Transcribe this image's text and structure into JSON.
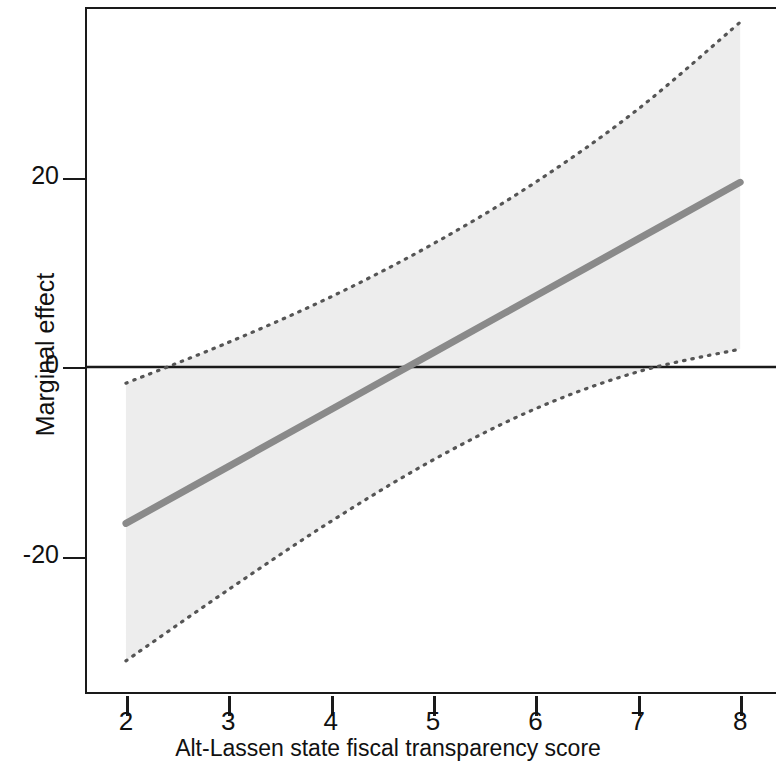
{
  "chart_data": {
    "type": "line",
    "title": "",
    "subtitle": "",
    "xlabel": "Alt-Lassen state fiscal transparency score",
    "ylabel": "Marginal effect",
    "xlim": [
      1.6,
      8.35
    ],
    "ylim": [
      -34.5,
      38.0
    ],
    "xticks": [
      2,
      3,
      4,
      5,
      6,
      7,
      8
    ],
    "xticklabels": [
      "2",
      "3",
      "4",
      "5",
      "6",
      "7",
      "8"
    ],
    "yticks": [
      20,
      0,
      -20
    ],
    "yticklabels": [
      "20",
      "0",
      "-20"
    ],
    "grid": false,
    "legend": null,
    "zero_reference_line": 0,
    "series": [
      {
        "name": "Marginal effect",
        "style": "solid",
        "color": "#8a8a8a",
        "linewidth": 7,
        "x": [
          2,
          3,
          4,
          5,
          6,
          7,
          8
        ],
        "values": [
          -16.5,
          -10.5,
          -4.5,
          1.5,
          7.5,
          13.5,
          19.5
        ]
      },
      {
        "name": "Upper 95% confidence bound",
        "style": "dotted",
        "color": "#555555",
        "linewidth": 3,
        "x": [
          2,
          3,
          4,
          5,
          6,
          7,
          8
        ],
        "values": [
          -1.7,
          2.6,
          7.4,
          13.0,
          19.5,
          27.2,
          36.4
        ]
      },
      {
        "name": "Lower 95% confidence bound",
        "style": "dotted",
        "color": "#555555",
        "linewidth": 3,
        "x": [
          2,
          3,
          4,
          5,
          6,
          7,
          8
        ],
        "values": [
          -31.0,
          -23.5,
          -16.3,
          -9.8,
          -4.4,
          -0.5,
          1.9
        ]
      }
    ],
    "confidence_band": {
      "name": "95% confidence interval",
      "fill_color": "#ededed",
      "x": [
        2,
        3,
        4,
        5,
        6,
        7,
        8
      ],
      "upper": [
        -1.7,
        2.6,
        7.4,
        13.0,
        19.5,
        27.2,
        36.4
      ],
      "lower": [
        -31.0,
        -23.5,
        -16.3,
        -9.8,
        -4.4,
        -0.5,
        1.9
      ]
    },
    "annotations": []
  },
  "axis": {
    "y_title": "Marginal effect",
    "x_title": "Alt-Lassen state fiscal transparency score",
    "y_tick_labels": [
      "20",
      "0",
      "-20"
    ],
    "x_tick_labels": [
      "2",
      "3",
      "4",
      "5",
      "6",
      "7",
      "8"
    ]
  },
  "colors": {
    "line": "#8a8a8a",
    "band_fill": "#ededed",
    "band_edge": "#555555",
    "axis": "#1a1a1a",
    "text": "#111111",
    "background": "#ffffff"
  }
}
